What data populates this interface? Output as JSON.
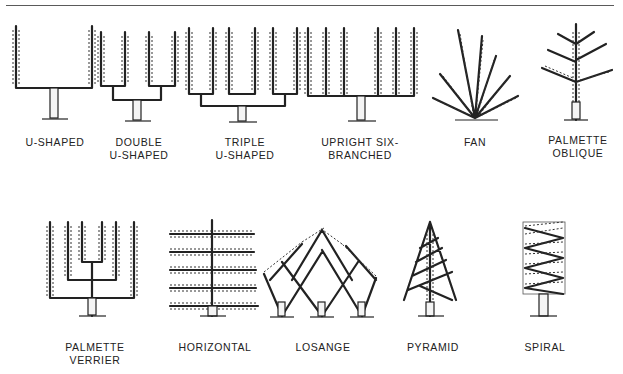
{
  "diagram": {
    "rows": [
      {
        "items": [
          {
            "id": "u-shaped",
            "label_lines": [
              "U-SHAPED"
            ]
          },
          {
            "id": "double-u-shaped",
            "label_lines": [
              "DOUBLE",
              "U-SHAPED"
            ]
          },
          {
            "id": "triple-u-shaped",
            "label_lines": [
              "TRIPLE",
              "U-SHAPED"
            ]
          },
          {
            "id": "upright-six-branched",
            "label_lines": [
              "UPRIGHT SIX-",
              "BRANCHED"
            ]
          },
          {
            "id": "fan",
            "label_lines": [
              "FAN"
            ]
          },
          {
            "id": "palmette-oblique",
            "label_lines": [
              "PALMETTE",
              "OBLIQUE"
            ]
          }
        ]
      },
      {
        "items": [
          {
            "id": "palmette-verrier",
            "label_lines": [
              "PALMETTE",
              "VERRIER"
            ]
          },
          {
            "id": "horizontal",
            "label_lines": [
              "HORIZONTAL"
            ]
          },
          {
            "id": "losange",
            "label_lines": [
              "LOSANGE"
            ]
          },
          {
            "id": "pyramid",
            "label_lines": [
              "PYRAMID"
            ]
          },
          {
            "id": "spiral",
            "label_lines": [
              "SPIRAL"
            ]
          }
        ]
      }
    ]
  },
  "colors": {
    "ink": "#222222",
    "background": "#ffffff",
    "rule": "#5a5a5a"
  }
}
